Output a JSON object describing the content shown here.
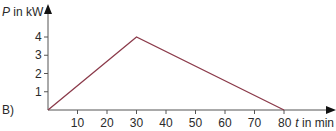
{
  "chart_data": {
    "type": "line",
    "title": "",
    "panel_label": "B)",
    "xlabel_var": "t",
    "xlabel_unit": "in min",
    "ylabel_var": "P",
    "ylabel_unit": "in kW",
    "x_ticks": [
      10,
      20,
      30,
      40,
      50,
      60,
      70,
      80
    ],
    "y_ticks": [
      1,
      2,
      3,
      4
    ],
    "xlim": [
      0,
      85
    ],
    "ylim": [
      0,
      4.7
    ],
    "grid": false,
    "series": [
      {
        "name": "P(t)",
        "color": "#8b3a4a",
        "points": [
          [
            0,
            0
          ],
          [
            30,
            4
          ],
          [
            80,
            0
          ]
        ]
      }
    ]
  },
  "labels": {
    "panel": "B)",
    "y_var": "P",
    "y_unit": " in kW",
    "x_var": "t",
    "x_unit": " in min",
    "x80": "80"
  }
}
